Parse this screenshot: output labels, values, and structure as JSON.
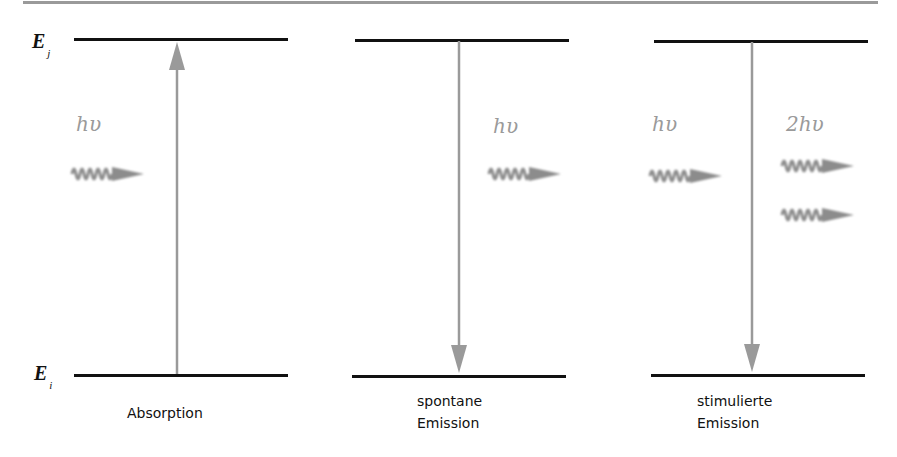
{
  "energy_levels": {
    "upper": {
      "symbol": "E",
      "subscript": "j"
    },
    "lower": {
      "symbol": "E",
      "subscript": "i"
    }
  },
  "panels": [
    {
      "id": "absorption",
      "caption_line1": "Absorption",
      "caption_line2": "",
      "photon_in_label": "hυ",
      "transition": "up"
    },
    {
      "id": "spontaneous-emission",
      "caption_line1": "spontane",
      "caption_line2": "Emission",
      "photon_out_label": "hυ",
      "transition": "down"
    },
    {
      "id": "stimulated-emission",
      "caption_line1": "stimulierte",
      "caption_line2": "Emission",
      "photon_in_label": "hυ",
      "photon_out_label": "2hυ",
      "transition": "down"
    }
  ],
  "colors": {
    "level_line": "#111111",
    "arrow": "#9a9a9a",
    "photon": "#8c8c8c",
    "text_gray": "#9a9a9a"
  }
}
